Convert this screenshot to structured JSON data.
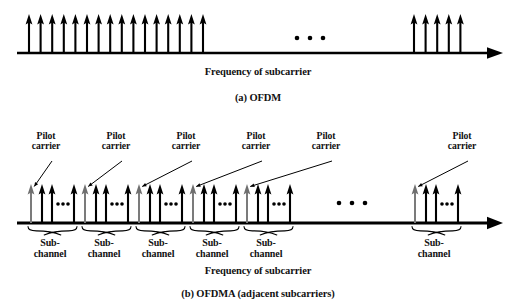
{
  "figure": {
    "background_color": "#ffffff",
    "ink_color": "#000000",
    "pilot_color": "#7b7b7b"
  },
  "panel_a": {
    "caption": "(a) OFDM",
    "axis_label": "Frequency of subcarrier",
    "ellipsis": "• • •"
  },
  "panel_b": {
    "caption": "(b) OFDMA (adjacent subcarriers)",
    "axis_label": "Frequency of subcarrier",
    "ellipsis": "• • •",
    "pilot_label_line1": "Pilot",
    "pilot_label_line2": "carrier",
    "sub_label_line1": "Sub-",
    "sub_label_line2": "channel",
    "pilot_labels": [
      {
        "id": "pilot-1",
        "x": 46
      },
      {
        "id": "pilot-2",
        "x": 116
      },
      {
        "id": "pilot-3",
        "x": 186
      },
      {
        "id": "pilot-4",
        "x": 256
      },
      {
        "id": "pilot-5",
        "x": 326
      },
      {
        "id": "pilot-6",
        "x": 462
      }
    ],
    "subchannel_labels": [
      {
        "id": "subchannel-1",
        "x": 50
      },
      {
        "id": "subchannel-2",
        "x": 104
      },
      {
        "id": "subchannel-3",
        "x": 158
      },
      {
        "id": "subchannel-4",
        "x": 212
      },
      {
        "id": "subchannel-5",
        "x": 266
      },
      {
        "id": "subchannel-6",
        "x": 434
      }
    ]
  },
  "chart_data": {
    "type": "line",
    "panels": [
      {
        "id": "a",
        "caption": "(a) OFDM",
        "xlabel": "Frequency of subcarrier",
        "axis": {
          "y": 53,
          "x_start": 17,
          "x_end": 500,
          "arrowhead": true
        },
        "series": [
          {
            "name": "subcarriers-left-block",
            "kind": "impulse",
            "color": "#000000",
            "count": 16,
            "x_start": 29,
            "x_step": 11.6,
            "top_y": 14,
            "x": [
              29,
              40.6,
              52.2,
              63.8,
              75.4,
              87,
              98.6,
              110.2,
              121.8,
              133.4,
              145,
              156.6,
              168.2,
              179.8,
              191.4,
              203
            ]
          },
          {
            "name": "subcarriers-right-block",
            "kind": "impulse",
            "color": "#000000",
            "count": 5,
            "x_start": 414,
            "x_step": 11.6,
            "top_y": 14,
            "x": [
              414,
              425.6,
              437.2,
              448.8,
              460.4
            ]
          }
        ],
        "annotations": [
          {
            "type": "ellipsis",
            "text": "• • •",
            "x": 305,
            "y": 38,
            "dots": 3,
            "dot_x": [
              297,
              310,
              323
            ]
          }
        ]
      },
      {
        "id": "b",
        "caption": "(b) OFDMA (adjacent subcarriers)",
        "xlabel": "Frequency of subcarrier",
        "axis": {
          "y": 223,
          "x_start": 17,
          "x_end": 500,
          "arrowhead": true
        },
        "subchannel_count_drawn": 6,
        "subchannel_pattern": {
          "arrows_per_subchannel": 4,
          "first_arrow_is_pilot": true,
          "pilot_color": "#7b7b7b",
          "normal_color": "#000000",
          "inner_ellipsis_dots": 3
        },
        "subchannels": [
          {
            "name": "subchannel-1",
            "pilot_x": 31,
            "arrow_x": [
              31,
              42,
              52,
              74
            ],
            "dots_x": [
              58,
              63,
              68
            ],
            "brace_x1": 28,
            "brace_x2": 77
          },
          {
            "name": "subchannel-2",
            "pilot_x": 85,
            "arrow_x": [
              85,
              96,
              106,
              128
            ],
            "dots_x": [
              112,
              117,
              122
            ],
            "brace_x1": 82,
            "brace_x2": 131
          },
          {
            "name": "subchannel-3",
            "pilot_x": 139,
            "arrow_x": [
              139,
              150,
              160,
              182
            ],
            "dots_x": [
              166,
              171,
              176
            ],
            "brace_x1": 136,
            "brace_x2": 185
          },
          {
            "name": "subchannel-4",
            "pilot_x": 193,
            "arrow_x": [
              193,
              204,
              214,
              236
            ],
            "dots_x": [
              220,
              225,
              230
            ],
            "brace_x1": 190,
            "brace_x2": 239
          },
          {
            "name": "subchannel-5",
            "pilot_x": 247,
            "arrow_x": [
              247,
              258,
              268,
              290
            ],
            "dots_x": [
              274,
              279,
              284
            ],
            "brace_x1": 244,
            "brace_x2": 293
          },
          {
            "name": "subchannel-6",
            "pilot_x": 415,
            "arrow_x": [
              415,
              426,
              436,
              458
            ],
            "dots_x": [
              442,
              447,
              452
            ],
            "brace_x1": 412,
            "brace_x2": 461
          }
        ],
        "arrow_top_y": 184,
        "annotations": [
          {
            "type": "ellipsis",
            "text": "• • •",
            "x": 351,
            "y": 203,
            "dots": 3,
            "dot_x": [
              339,
              352,
              365
            ]
          },
          {
            "type": "callout",
            "label": "Pilot carrier",
            "target": "subchannel-1"
          },
          {
            "type": "callout",
            "label": "Pilot carrier",
            "target": "subchannel-2"
          },
          {
            "type": "callout",
            "label": "Pilot carrier",
            "target": "subchannel-3"
          },
          {
            "type": "callout",
            "label": "Pilot carrier",
            "target": "subchannel-4"
          },
          {
            "type": "callout",
            "label": "Pilot carrier",
            "target": "subchannel-5"
          },
          {
            "type": "callout",
            "label": "Pilot carrier",
            "target": "subchannel-6"
          }
        ]
      }
    ]
  }
}
